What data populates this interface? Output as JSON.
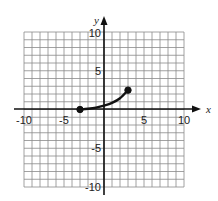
{
  "chart_data": {
    "type": "line",
    "title": "",
    "xlabel": "x",
    "ylabel": "y",
    "xlim": [
      -10,
      10
    ],
    "ylim": [
      -10,
      10
    ],
    "grid": true,
    "x_tick_labels": [
      "-10",
      "-5",
      "5",
      "10"
    ],
    "y_tick_labels": [
      "10",
      "5",
      "-5",
      "-10"
    ],
    "series": [
      {
        "name": "curve",
        "x": [
          -3,
          -2,
          -1,
          0,
          1,
          2,
          3
        ],
        "values": [
          0,
          0.1,
          0.25,
          0.5,
          0.85,
          1.45,
          2.5
        ],
        "endpoints": [
          {
            "x": -3,
            "y": 0,
            "filled": true
          },
          {
            "x": 3,
            "y": 2.5,
            "filled": true
          }
        ]
      }
    ]
  },
  "labels": {
    "x_axis": "x",
    "y_axis": "y",
    "xt_m10": "-10",
    "xt_m5": "-5",
    "xt_5": "5",
    "xt_10": "10",
    "yt_10": "10",
    "yt_5": "5",
    "yt_m5": "-5",
    "yt_m10": "-10"
  },
  "colors": {
    "grid": "#8a8a8a",
    "axis": "#111111",
    "curve": "#111111"
  }
}
